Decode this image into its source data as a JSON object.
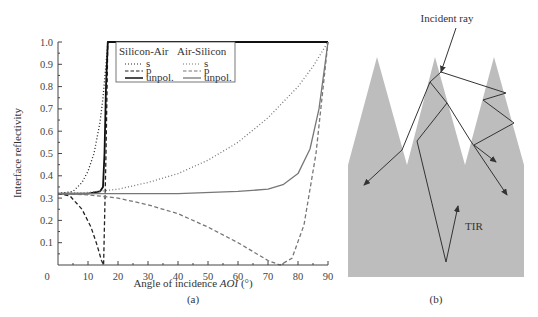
{
  "figure": {
    "panel_a_caption": "(a)",
    "panel_b_caption": "(b)"
  },
  "chart_data": {
    "type": "line",
    "title": "",
    "xlabel": "Angle of incidence AOI (°)",
    "xlabel_plain": "Angle of incidence ",
    "xlabel_italic": "AOI",
    "xlabel_unit": " (°)",
    "ylabel": "Interface reflectivity",
    "xlim": [
      0,
      90
    ],
    "ylim": [
      0,
      1.0
    ],
    "x_ticks": [
      "0",
      "10",
      "20",
      "30",
      "40",
      "50",
      "60",
      "70",
      "80",
      "90"
    ],
    "y_ticks": [
      "0.1",
      "0.2",
      "0.3",
      "0.4",
      "0.5",
      "0.6",
      "0.7",
      "0.8",
      "0.9",
      "1.0"
    ],
    "grid": false,
    "legend_position": "upper-left inside",
    "legend": {
      "group1_title": "Silicon-Air",
      "group2_title": "Air-Silicon",
      "entries": [
        "s",
        "p",
        "unpol."
      ]
    },
    "series": [
      {
        "name": "Silicon-Air s",
        "style": "dotted",
        "color": "#222222",
        "x": [
          0,
          5,
          8,
          10,
          12,
          14,
          15,
          16,
          16.6,
          17,
          90
        ],
        "y": [
          0.32,
          0.33,
          0.37,
          0.42,
          0.5,
          0.64,
          0.75,
          0.9,
          1.0,
          1.0,
          1.0
        ]
      },
      {
        "name": "Silicon-Air p",
        "style": "dashed",
        "color": "#222222",
        "x": [
          0,
          4,
          8,
          11,
          13,
          14.5,
          15.2,
          16,
          16.6,
          17,
          90
        ],
        "y": [
          0.32,
          0.31,
          0.25,
          0.17,
          0.09,
          0.02,
          0.0,
          0.5,
          1.0,
          1.0,
          1.0
        ]
      },
      {
        "name": "Silicon-Air unpol.",
        "style": "solid",
        "color": "#111111",
        "x": [
          0,
          10,
          14,
          15,
          15.5,
          16,
          16.6,
          17,
          90
        ],
        "y": [
          0.32,
          0.32,
          0.33,
          0.35,
          0.5,
          0.8,
          1.0,
          1.0,
          1.0
        ]
      },
      {
        "name": "Air-Silicon s",
        "style": "dotted",
        "color": "#777777",
        "x": [
          0,
          10,
          20,
          30,
          40,
          50,
          60,
          70,
          80,
          85,
          90
        ],
        "y": [
          0.32,
          0.325,
          0.34,
          0.37,
          0.41,
          0.47,
          0.55,
          0.66,
          0.8,
          0.89,
          1.0
        ]
      },
      {
        "name": "Air-Silicon p",
        "style": "dashed",
        "color": "#777777",
        "x": [
          0,
          10,
          20,
          30,
          40,
          50,
          60,
          65,
          70,
          74,
          78,
          82,
          86,
          90
        ],
        "y": [
          0.32,
          0.315,
          0.3,
          0.27,
          0.23,
          0.17,
          0.1,
          0.06,
          0.02,
          0.0,
          0.03,
          0.18,
          0.5,
          1.0
        ]
      },
      {
        "name": "Air-Silicon unpol.",
        "style": "solid",
        "color": "#777777",
        "x": [
          0,
          20,
          40,
          60,
          70,
          75,
          80,
          84,
          87,
          90
        ],
        "y": [
          0.32,
          0.32,
          0.32,
          0.33,
          0.34,
          0.36,
          0.41,
          0.52,
          0.7,
          1.0
        ]
      }
    ]
  },
  "diagram": {
    "incident_label": "Incident ray",
    "tir_label": "TIR",
    "fill_color": "#bdbdbd",
    "ray_color": "#333333"
  }
}
